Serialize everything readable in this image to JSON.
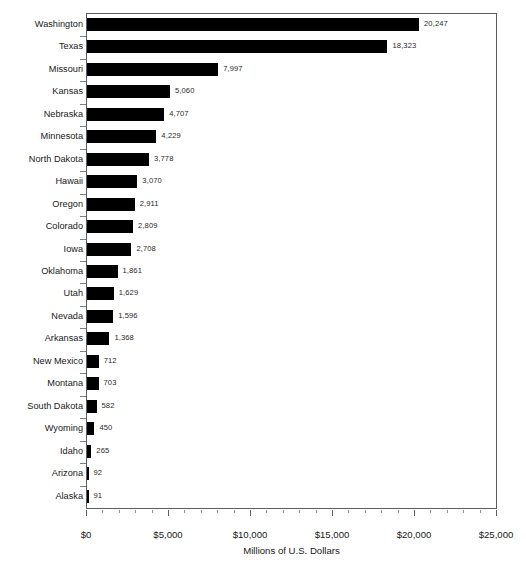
{
  "chart_data": {
    "type": "bar",
    "orientation": "horizontal",
    "title": "",
    "xlabel": "Millions of U.S. Dollars",
    "ylabel": "",
    "xlim": [
      0,
      25000
    ],
    "xticks": [
      0,
      5000,
      10000,
      15000,
      20000,
      25000
    ],
    "xtick_labels": [
      "$0",
      "$5,000",
      "$10,000",
      "$15,000",
      "$20,000",
      "$25,000"
    ],
    "xtick_minor_step": 1000,
    "grid": false,
    "legend": null,
    "bar_color": "#000000",
    "frame_color": "#5a5f63",
    "background": "#ffffff",
    "show_value_labels": true,
    "categories": [
      "Washington",
      "Texas",
      "Missouri",
      "Kansas",
      "Nebraska",
      "Minnesota",
      "North Dakota",
      "Hawaii",
      "Oregon",
      "Colorado",
      "Iowa",
      "Oklahoma",
      "Utah",
      "Nevada",
      "Arkansas",
      "New Mexico",
      "Montana",
      "South Dakota",
      "Wyoming",
      "Idaho",
      "Arizona",
      "Alaska"
    ],
    "values": [
      20247,
      18323,
      7997,
      5060,
      4707,
      4229,
      3778,
      3070,
      2911,
      2809,
      2708,
      1861,
      1629,
      1596,
      1368,
      712,
      703,
      582,
      450,
      265,
      92,
      91
    ],
    "value_labels": [
      "20,247",
      "18,323",
      "7,997",
      "5,060",
      "4,707",
      "4,229",
      "3,778",
      "3,070",
      "2,911",
      "2,809",
      "2,708",
      "1,861",
      "1,629",
      "1,596",
      "1,368",
      "712",
      "703",
      "582",
      "450",
      "265",
      "92",
      "91"
    ]
  }
}
